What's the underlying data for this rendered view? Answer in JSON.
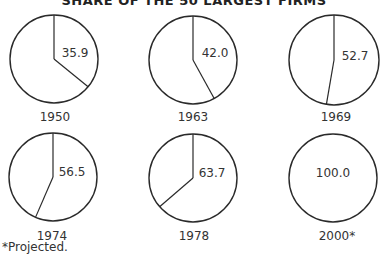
{
  "title": "SHARE OF THE 50 LARGEST FIRMS",
  "footnote": "*Projected.",
  "chart_data": {
    "type": "pie",
    "title": "SHARE OF THE 50 LARGEST FIRMS",
    "charts": [
      {
        "label": "1950",
        "value": 35.9
      },
      {
        "label": "1963",
        "value": 42.0
      },
      {
        "label": "1969",
        "value": 52.7
      },
      {
        "label": "1974",
        "value": 56.5
      },
      {
        "label": "1978",
        "value": 63.7
      },
      {
        "label": "2000*",
        "value": 100.0,
        "projected": true
      }
    ],
    "units": "percent",
    "footnote": "*Projected."
  },
  "layout": {
    "pies": [
      {
        "cx": 54,
        "cy": 59,
        "r": 44,
        "tx": 75,
        "ty": 57,
        "lx": 55,
        "ly": 121
      },
      {
        "cx": 193,
        "cy": 60,
        "r": 44,
        "tx": 215,
        "ty": 57,
        "lx": 193,
        "ly": 121
      },
      {
        "cx": 334,
        "cy": 60,
        "r": 45,
        "tx": 355,
        "ty": 60,
        "lx": 336,
        "ly": 121
      },
      {
        "cx": 53,
        "cy": 177,
        "r": 44,
        "tx": 72,
        "ty": 176,
        "lx": 52,
        "ly": 240
      },
      {
        "cx": 193,
        "cy": 178,
        "r": 44,
        "tx": 212,
        "ty": 177,
        "lx": 194,
        "ly": 240
      },
      {
        "cx": 333,
        "cy": 178,
        "r": 44,
        "tx": 333,
        "ty": 177,
        "lx": 337,
        "ly": 240
      }
    ]
  }
}
